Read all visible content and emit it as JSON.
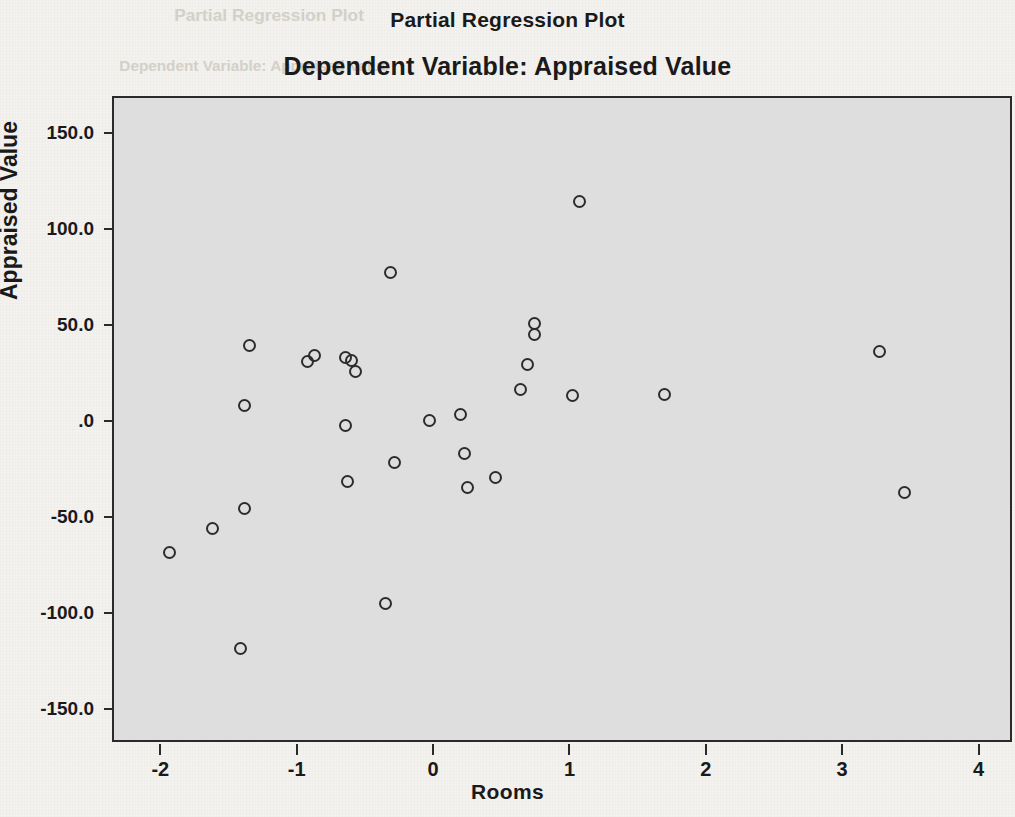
{
  "header": {
    "title": "Partial Regression Plot",
    "subtitle": "Dependent Variable: Appraised Value"
  },
  "ghost_text": {
    "line1": "Partial Regression Plot",
    "line2": "Dependent Variable: Appraised Value"
  },
  "axes": {
    "x_title": "Rooms",
    "y_title": "Appraised Value",
    "x_ticks": [
      "-2",
      "-1",
      "0",
      "1",
      "2",
      "3",
      "4"
    ],
    "y_ticks": [
      "150.0",
      "100.0",
      "50.0",
      ".0",
      "-50.0",
      "-100.0",
      "-150.0"
    ]
  },
  "colors": {
    "plot_background": "#dedede",
    "page_background": "#f3f2ee",
    "axis": "#2a2a2a",
    "marker": "#2c2c2c"
  },
  "chart_data": {
    "type": "scatter",
    "title": "Partial Regression Plot",
    "subtitle": "Dependent Variable: Appraised Value",
    "xlabel": "Rooms",
    "ylabel": "Appraised Value",
    "xlim": [
      -2.34,
      4.26
    ],
    "ylim": [
      -168.5,
      168.5
    ],
    "xticks": [
      -2,
      -1,
      0,
      1,
      2,
      3,
      4
    ],
    "yticks": [
      -150.0,
      -100.0,
      -50.0,
      0.0,
      50.0,
      100.0,
      150.0
    ],
    "grid": false,
    "legend": false,
    "marker": "open-circle",
    "points": [
      {
        "x": -1.93,
        "y": -68.5
      },
      {
        "x": -1.62,
        "y": -56.0
      },
      {
        "x": -1.41,
        "y": -118.5
      },
      {
        "x": -1.38,
        "y": -45.5
      },
      {
        "x": -1.38,
        "y": 8.0
      },
      {
        "x": -1.35,
        "y": 39.5
      },
      {
        "x": -0.92,
        "y": 31.0
      },
      {
        "x": -0.87,
        "y": 34.0
      },
      {
        "x": -0.64,
        "y": 33.0
      },
      {
        "x": -0.6,
        "y": 31.5
      },
      {
        "x": -0.57,
        "y": 26.0
      },
      {
        "x": -0.64,
        "y": -2.5
      },
      {
        "x": -0.63,
        "y": -31.5
      },
      {
        "x": -0.31,
        "y": 77.5
      },
      {
        "x": -0.28,
        "y": -21.5
      },
      {
        "x": -0.03,
        "y": 0.5
      },
      {
        "x": 0.2,
        "y": 3.5
      },
      {
        "x": 0.23,
        "y": -17.0
      },
      {
        "x": 0.25,
        "y": -34.5
      },
      {
        "x": 0.46,
        "y": -29.5
      },
      {
        "x": 0.64,
        "y": 16.5
      },
      {
        "x": 0.69,
        "y": 29.5
      },
      {
        "x": 0.74,
        "y": 51.0
      },
      {
        "x": 0.74,
        "y": 45.0
      },
      {
        "x": 1.07,
        "y": 114.5
      },
      {
        "x": 1.02,
        "y": 13.5
      },
      {
        "x": 1.7,
        "y": 14.0
      },
      {
        "x": 3.27,
        "y": 36.5
      },
      {
        "x": 3.46,
        "y": -37.5
      },
      {
        "x": -0.35,
        "y": -95.0
      }
    ]
  }
}
